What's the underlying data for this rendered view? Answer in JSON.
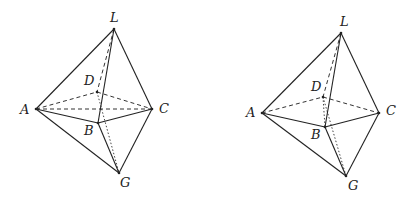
{
  "figures": [
    {
      "id": "left",
      "vertices": {
        "L": [
          114,
          29
        ],
        "A": [
          36,
          109
        ],
        "C": [
          152,
          109
        ],
        "B": [
          98,
          123
        ],
        "D": [
          97,
          92
        ],
        "G": [
          119,
          173
        ]
      },
      "labels": {
        "L": {
          "text": "L",
          "pos": [
            110,
            22
          ]
        },
        "D": {
          "text": "D",
          "pos": [
            84,
            85
          ]
        },
        "A": {
          "text": "A",
          "pos": [
            20,
            114
          ]
        },
        "C": {
          "text": "C",
          "pos": [
            159,
            113
          ]
        },
        "B": {
          "text": "B",
          "pos": [
            84,
            135
          ]
        },
        "G": {
          "text": "G",
          "pos": [
            120,
            187
          ]
        }
      },
      "solid_edges": [
        [
          "L",
          "A"
        ],
        [
          "L",
          "C"
        ],
        [
          "L",
          "B"
        ],
        [
          "A",
          "B"
        ],
        [
          "B",
          "C"
        ],
        [
          "A",
          "G"
        ],
        [
          "C",
          "G"
        ],
        [
          "B",
          "G"
        ]
      ],
      "dashed_edges": [
        [
          "L",
          "D"
        ],
        [
          "A",
          "D"
        ],
        [
          "D",
          "C"
        ],
        [
          "A",
          "C"
        ]
      ],
      "dotted_edges": [
        [
          "D",
          "G"
        ]
      ]
    },
    {
      "id": "right",
      "vertices": {
        "L": [
          341,
          33
        ],
        "A": [
          262,
          113
        ],
        "C": [
          379,
          113
        ],
        "B": [
          325,
          127
        ],
        "D": [
          323,
          97
        ],
        "G": [
          346,
          176
        ]
      },
      "labels": {
        "L": {
          "text": "L",
          "pos": [
            340,
            26
          ]
        },
        "D": {
          "text": "D",
          "pos": [
            311,
            91
          ]
        },
        "A": {
          "text": "A",
          "pos": [
            246,
            117
          ]
        },
        "C": {
          "text": "C",
          "pos": [
            386,
            115
          ]
        },
        "B": {
          "text": "B",
          "pos": [
            311,
            139
          ]
        },
        "G": {
          "text": "G",
          "pos": [
            348,
            190
          ]
        }
      },
      "solid_edges": [
        [
          "L",
          "A"
        ],
        [
          "L",
          "C"
        ],
        [
          "L",
          "B"
        ],
        [
          "A",
          "B"
        ],
        [
          "B",
          "C"
        ],
        [
          "A",
          "G"
        ],
        [
          "C",
          "G"
        ],
        [
          "B",
          "G"
        ]
      ],
      "dashed_edges": [
        [
          "L",
          "D"
        ],
        [
          "A",
          "D"
        ],
        [
          "D",
          "C"
        ]
      ],
      "dotted_edges": [
        [
          "D",
          "G"
        ],
        [
          "D",
          "B"
        ]
      ]
    }
  ]
}
